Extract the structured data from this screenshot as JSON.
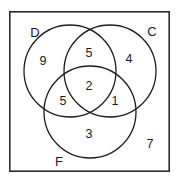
{
  "diagram": {
    "type": "venn",
    "title": "",
    "universe": {
      "label": "",
      "outside_value": "7"
    },
    "colors": {
      "stroke": "#1c1c1c",
      "box_stroke": "#2b2b2b",
      "background": "#ffffff",
      "text": "#1c1c1c"
    },
    "sets": [
      {
        "id": "D",
        "label": "D",
        "label_x": 35,
        "label_y": 32
      },
      {
        "id": "C",
        "label": "C",
        "label_x": 152,
        "label_y": 31
      },
      {
        "id": "F",
        "label": "F",
        "label_x": 59,
        "label_y": 161
      }
    ],
    "regions": [
      {
        "id": "D-only",
        "label": "D only",
        "value": "9",
        "x": 43,
        "y": 61
      },
      {
        "id": "C-only",
        "label": "C only",
        "value": "4",
        "x": 129,
        "y": 59
      },
      {
        "id": "F-only",
        "label": "F only",
        "value": "3",
        "x": 89,
        "y": 134
      },
      {
        "id": "D-and-C",
        "label": "D and C",
        "value": "5",
        "x": 89,
        "y": 53
      },
      {
        "id": "D-and-F",
        "label": "D and F",
        "value": "5",
        "x": 63,
        "y": 101
      },
      {
        "id": "C-and-F",
        "label": "C and F",
        "value": "1",
        "x": 115,
        "y": 101
      },
      {
        "id": "D-C-F",
        "label": "D and C and F",
        "value": "2",
        "x": 89,
        "y": 86
      },
      {
        "id": "outside",
        "label": "Outside all",
        "value": "7",
        "x": 150,
        "y": 144
      }
    ],
    "geometry": {
      "box": {
        "x": 9,
        "y": 11,
        "width": 161,
        "height": 161
      },
      "circles": [
        {
          "id": "D",
          "cx": 70,
          "cy": 71,
          "r": 46
        },
        {
          "id": "C",
          "cx": 110,
          "cy": 71,
          "r": 46
        },
        {
          "id": "F",
          "cx": 90,
          "cy": 112,
          "r": 46
        }
      ]
    }
  }
}
